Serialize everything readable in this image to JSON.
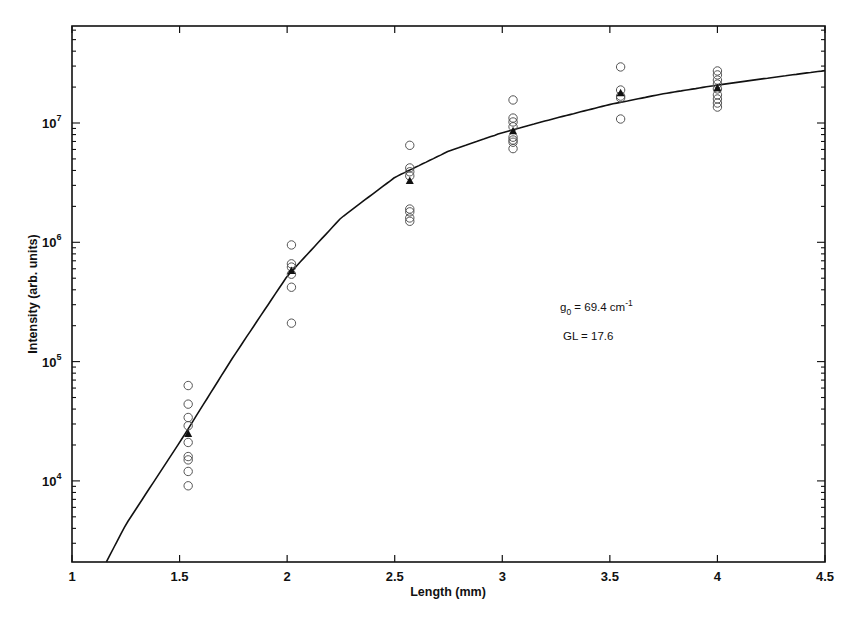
{
  "chart_data": {
    "type": "scatter",
    "title": "",
    "xlabel": "Length (mm)",
    "ylabel": "Intensity (arb. units)",
    "xlim": [
      1,
      4.5
    ],
    "ylim": [
      2100,
      65000000
    ],
    "yscale": "log",
    "grid": false,
    "legend": null,
    "x_ticks": [
      "1",
      "1.5",
      "2",
      "2.5",
      "3",
      "3.5",
      "4",
      "4.5"
    ],
    "y_ticks": [
      {
        "base": "10",
        "exp": "4",
        "value": 10000
      },
      {
        "base": "10",
        "exp": "5",
        "value": 100000
      },
      {
        "base": "10",
        "exp": "6",
        "value": 1000000
      },
      {
        "base": "10",
        "exp": "7",
        "value": 10000000
      }
    ],
    "annotations": [
      {
        "text_main": "g",
        "sub": "0",
        "rest": " = 69.4 cm",
        "sup": "-1"
      },
      {
        "text": "GL = 17.6"
      }
    ],
    "series": [
      {
        "name": "measurements",
        "marker": "open-circle",
        "points": [
          {
            "x": 1.54,
            "y": 63000
          },
          {
            "x": 1.54,
            "y": 44000
          },
          {
            "x": 1.54,
            "y": 34000
          },
          {
            "x": 1.54,
            "y": 29000
          },
          {
            "x": 1.54,
            "y": 21000
          },
          {
            "x": 1.54,
            "y": 16000
          },
          {
            "x": 1.54,
            "y": 15000
          },
          {
            "x": 1.54,
            "y": 12000
          },
          {
            "x": 1.54,
            "y": 9100
          },
          {
            "x": 2.02,
            "y": 950000
          },
          {
            "x": 2.02,
            "y": 660000
          },
          {
            "x": 2.02,
            "y": 620000
          },
          {
            "x": 2.02,
            "y": 540000
          },
          {
            "x": 2.02,
            "y": 420000
          },
          {
            "x": 2.02,
            "y": 210000
          },
          {
            "x": 2.57,
            "y": 6500000
          },
          {
            "x": 2.57,
            "y": 4200000
          },
          {
            "x": 2.57,
            "y": 3900000
          },
          {
            "x": 2.57,
            "y": 3600000
          },
          {
            "x": 2.57,
            "y": 1900000
          },
          {
            "x": 2.57,
            "y": 1800000
          },
          {
            "x": 2.57,
            "y": 1600000
          },
          {
            "x": 2.57,
            "y": 1500000
          },
          {
            "x": 3.05,
            "y": 15600000
          },
          {
            "x": 3.05,
            "y": 11000000
          },
          {
            "x": 3.05,
            "y": 10200000
          },
          {
            "x": 3.05,
            "y": 9300000
          },
          {
            "x": 3.05,
            "y": 7600000
          },
          {
            "x": 3.05,
            "y": 7200000
          },
          {
            "x": 3.05,
            "y": 6900000
          },
          {
            "x": 3.05,
            "y": 6100000
          },
          {
            "x": 3.55,
            "y": 29500000
          },
          {
            "x": 3.55,
            "y": 18900000
          },
          {
            "x": 3.55,
            "y": 16800000
          },
          {
            "x": 3.55,
            "y": 16200000
          },
          {
            "x": 3.55,
            "y": 10800000
          },
          {
            "x": 4.0,
            "y": 27300000
          },
          {
            "x": 4.0,
            "y": 25300000
          },
          {
            "x": 4.0,
            "y": 22900000
          },
          {
            "x": 4.0,
            "y": 21200000
          },
          {
            "x": 4.0,
            "y": 19300000
          },
          {
            "x": 4.0,
            "y": 17200000
          },
          {
            "x": 4.0,
            "y": 15900000
          },
          {
            "x": 4.0,
            "y": 14700000
          },
          {
            "x": 4.0,
            "y": 13600000
          }
        ]
      },
      {
        "name": "mean",
        "marker": "filled-triangle",
        "points": [
          {
            "x": 1.54,
            "y": 25000
          },
          {
            "x": 2.02,
            "y": 580000
          },
          {
            "x": 2.57,
            "y": 3300000
          },
          {
            "x": 3.05,
            "y": 8600000
          },
          {
            "x": 3.55,
            "y": 17900000
          },
          {
            "x": 4.0,
            "y": 19700000
          }
        ]
      },
      {
        "name": "fit",
        "type": "line",
        "points": [
          {
            "x": 1.16,
            "y": 2100
          },
          {
            "x": 1.25,
            "y": 4300
          },
          {
            "x": 1.5,
            "y": 21000
          },
          {
            "x": 1.75,
            "y": 110000
          },
          {
            "x": 2.0,
            "y": 520000
          },
          {
            "x": 2.25,
            "y": 1600000
          },
          {
            "x": 2.5,
            "y": 3500000
          },
          {
            "x": 2.75,
            "y": 5800000
          },
          {
            "x": 3.0,
            "y": 8300000
          },
          {
            "x": 3.25,
            "y": 11000000
          },
          {
            "x": 3.5,
            "y": 14300000
          },
          {
            "x": 3.75,
            "y": 17600000
          },
          {
            "x": 4.0,
            "y": 20800000
          },
          {
            "x": 4.25,
            "y": 24000000
          },
          {
            "x": 4.5,
            "y": 27500000
          }
        ]
      }
    ]
  }
}
